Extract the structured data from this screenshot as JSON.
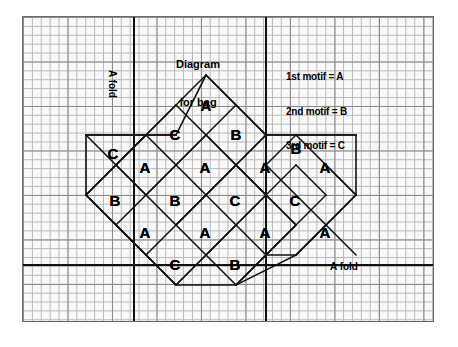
{
  "document": {
    "kind": "craft-pattern-diagram",
    "background_color": "#ffffff",
    "sheet_color": "#fdfdfd",
    "grid_line_color": "#8f8f8f",
    "ink_color": "#000000"
  },
  "title": {
    "line1": "Diagram",
    "line2": "for bag"
  },
  "legend": {
    "entries": [
      {
        "label": "1st motif = A",
        "motif": "A",
        "order": "1st"
      },
      {
        "label": "2nd motif = B",
        "motif": "B",
        "order": "2nd"
      },
      {
        "label": "3rd motif = C",
        "motif": "C",
        "order": "3rd"
      }
    ],
    "text_block": "1st motif =A\n2nd motif =B\n3rd motif =C"
  },
  "fold_labels": {
    "vertical": "A fold",
    "horizontal": "A fold"
  },
  "fold_lines": [
    {
      "name": "vertical-fold-left",
      "orientation": "vertical",
      "x": 133,
      "y1": 17,
      "y2": 321
    },
    {
      "name": "vertical-fold-right",
      "orientation": "vertical",
      "x": 265,
      "y1": 17,
      "y2": 321
    },
    {
      "name": "horizontal-fold",
      "orientation": "horizontal",
      "y": 264,
      "x1": 23,
      "x2": 433
    }
  ],
  "grid": {
    "minor_cell_px": 8.9,
    "major_cell_px": 44.5,
    "sheet_left": 22,
    "sheet_top": 16,
    "sheet_width": 412,
    "sheet_height": 306
  },
  "motif_cells": [
    {
      "letter": "A",
      "x": 206,
      "y": 105,
      "row": 0,
      "col": 0
    },
    {
      "letter": "C",
      "x": 175,
      "y": 134,
      "row": 1,
      "col": 0
    },
    {
      "letter": "B",
      "x": 236,
      "y": 134,
      "row": 1,
      "col": 1
    },
    {
      "letter": "B",
      "x": 296,
      "y": 148,
      "row": 1,
      "col": 2
    },
    {
      "letter": "C",
      "x": 113,
      "y": 153,
      "row": 2,
      "col": 0
    },
    {
      "letter": "A",
      "x": 145,
      "y": 167,
      "row": 2,
      "col": 1
    },
    {
      "letter": "A",
      "x": 205,
      "y": 167,
      "row": 2,
      "col": 2
    },
    {
      "letter": "A",
      "x": 265,
      "y": 167,
      "row": 2,
      "col": 3
    },
    {
      "letter": "A",
      "x": 325,
      "y": 167,
      "row": 2,
      "col": 4
    },
    {
      "letter": "B",
      "x": 115,
      "y": 200,
      "row": 3,
      "col": 0
    },
    {
      "letter": "B",
      "x": 175,
      "y": 200,
      "row": 3,
      "col": 1
    },
    {
      "letter": "C",
      "x": 235,
      "y": 200,
      "row": 3,
      "col": 2
    },
    {
      "letter": "C",
      "x": 295,
      "y": 200,
      "row": 3,
      "col": 3
    },
    {
      "letter": "A",
      "x": 145,
      "y": 232,
      "row": 4,
      "col": 0
    },
    {
      "letter": "A",
      "x": 205,
      "y": 232,
      "row": 4,
      "col": 1
    },
    {
      "letter": "A",
      "x": 265,
      "y": 232,
      "row": 4,
      "col": 2
    },
    {
      "letter": "A",
      "x": 325,
      "y": 232,
      "row": 4,
      "col": 3
    },
    {
      "letter": "C",
      "x": 175,
      "y": 264,
      "row": 5,
      "col": 0
    },
    {
      "letter": "B",
      "x": 235,
      "y": 264,
      "row": 5,
      "col": 1
    }
  ],
  "diamond_outline": {
    "description": "rotated-square lattice of motif blocks",
    "stroke": "#111111",
    "stroke_width": 1.5
  }
}
